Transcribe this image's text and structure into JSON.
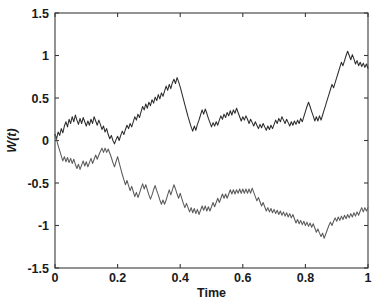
{
  "chart_data": {
    "type": "line",
    "title": "",
    "xlabel": "Time",
    "ylabel": "W(t)",
    "xlim": [
      0,
      1
    ],
    "ylim": [
      -1.5,
      1.5
    ],
    "grid": false,
    "legend": "none",
    "xticks": [
      0,
      0.2,
      0.4,
      0.6,
      0.8,
      1
    ],
    "xtick_labels": [
      "0",
      "0.2",
      "0.4",
      "0.6",
      "0.8",
      "1"
    ],
    "yticks": [
      -1.5,
      -1,
      -0.5,
      0,
      0.5,
      1,
      1.5
    ],
    "ytick_labels": [
      "-1.5",
      "-1",
      "-0.5",
      "0",
      "0.5",
      "1",
      "1.5"
    ],
    "x": [
      0,
      0.005,
      0.01,
      0.015,
      0.02,
      0.025,
      0.03,
      0.035,
      0.04,
      0.045,
      0.05,
      0.055,
      0.06,
      0.065,
      0.07,
      0.075,
      0.08,
      0.085,
      0.09,
      0.095,
      0.1,
      0.105,
      0.11,
      0.115,
      0.12,
      0.125,
      0.13,
      0.135,
      0.14,
      0.145,
      0.15,
      0.155,
      0.16,
      0.165,
      0.17,
      0.175,
      0.18,
      0.185,
      0.19,
      0.195,
      0.2,
      0.205,
      0.21,
      0.215,
      0.22,
      0.225,
      0.23,
      0.235,
      0.24,
      0.245,
      0.25,
      0.255,
      0.26,
      0.265,
      0.27,
      0.275,
      0.28,
      0.285,
      0.29,
      0.295,
      0.3,
      0.305,
      0.31,
      0.315,
      0.32,
      0.325,
      0.33,
      0.335,
      0.34,
      0.345,
      0.35,
      0.355,
      0.36,
      0.365,
      0.37,
      0.375,
      0.38,
      0.385,
      0.39,
      0.395,
      0.4,
      0.405,
      0.41,
      0.415,
      0.42,
      0.425,
      0.43,
      0.435,
      0.44,
      0.445,
      0.45,
      0.455,
      0.46,
      0.465,
      0.47,
      0.475,
      0.48,
      0.485,
      0.49,
      0.495,
      0.5,
      0.505,
      0.51,
      0.515,
      0.52,
      0.525,
      0.53,
      0.535,
      0.54,
      0.545,
      0.55,
      0.555,
      0.56,
      0.565,
      0.57,
      0.575,
      0.58,
      0.585,
      0.59,
      0.595,
      0.6,
      0.605,
      0.61,
      0.615,
      0.62,
      0.625,
      0.63,
      0.635,
      0.64,
      0.645,
      0.65,
      0.655,
      0.66,
      0.665,
      0.67,
      0.675,
      0.68,
      0.685,
      0.69,
      0.695,
      0.7,
      0.705,
      0.71,
      0.715,
      0.72,
      0.725,
      0.73,
      0.735,
      0.74,
      0.745,
      0.75,
      0.755,
      0.76,
      0.765,
      0.77,
      0.775,
      0.78,
      0.785,
      0.79,
      0.795,
      0.8,
      0.805,
      0.81,
      0.815,
      0.82,
      0.825,
      0.83,
      0.835,
      0.84,
      0.845,
      0.85,
      0.855,
      0.86,
      0.865,
      0.87,
      0.875,
      0.88,
      0.885,
      0.89,
      0.895,
      0.9,
      0.905,
      0.91,
      0.915,
      0.92,
      0.925,
      0.93,
      0.935,
      0.94,
      0.945,
      0.95,
      0.955,
      0.96,
      0.965,
      0.97,
      0.975,
      0.98,
      0.985,
      0.99,
      0.995,
      1
    ],
    "series": [
      {
        "name": "W1",
        "color": "#2b2b2b",
        "values": [
          0.07,
          0.02,
          0.1,
          0.06,
          0.14,
          0.09,
          0.17,
          0.22,
          0.16,
          0.25,
          0.2,
          0.28,
          0.22,
          0.3,
          0.24,
          0.19,
          0.26,
          0.2,
          0.27,
          0.22,
          0.17,
          0.23,
          0.18,
          0.25,
          0.2,
          0.28,
          0.23,
          0.18,
          0.24,
          0.19,
          0.13,
          0.17,
          0.1,
          0.14,
          0.07,
          0.02,
          0.06,
          0.0,
          -0.04,
          0.01,
          0.05,
          0.0,
          0.06,
          0.11,
          0.07,
          0.13,
          0.18,
          0.14,
          0.2,
          0.16,
          0.22,
          0.28,
          0.24,
          0.31,
          0.27,
          0.34,
          0.4,
          0.36,
          0.43,
          0.38,
          0.45,
          0.41,
          0.48,
          0.44,
          0.51,
          0.47,
          0.54,
          0.49,
          0.56,
          0.52,
          0.58,
          0.64,
          0.59,
          0.66,
          0.61,
          0.68,
          0.72,
          0.67,
          0.74,
          0.69,
          0.63,
          0.56,
          0.49,
          0.42,
          0.35,
          0.28,
          0.22,
          0.16,
          0.11,
          0.17,
          0.12,
          0.19,
          0.24,
          0.3,
          0.36,
          0.31,
          0.37,
          0.32,
          0.26,
          0.21,
          0.16,
          0.21,
          0.17,
          0.22,
          0.18,
          0.24,
          0.29,
          0.25,
          0.31,
          0.27,
          0.33,
          0.29,
          0.35,
          0.3,
          0.36,
          0.32,
          0.38,
          0.33,
          0.28,
          0.23,
          0.28,
          0.24,
          0.29,
          0.25,
          0.2,
          0.25,
          0.21,
          0.17,
          0.22,
          0.18,
          0.14,
          0.19,
          0.15,
          0.2,
          0.16,
          0.12,
          0.17,
          0.13,
          0.18,
          0.14,
          0.19,
          0.24,
          0.2,
          0.26,
          0.22,
          0.28,
          0.24,
          0.2,
          0.25,
          0.21,
          0.17,
          0.22,
          0.18,
          0.23,
          0.19,
          0.24,
          0.2,
          0.26,
          0.22,
          0.28,
          0.34,
          0.4,
          0.45,
          0.4,
          0.34,
          0.29,
          0.23,
          0.28,
          0.23,
          0.29,
          0.24,
          0.3,
          0.36,
          0.42,
          0.48,
          0.54,
          0.6,
          0.66,
          0.62,
          0.68,
          0.74,
          0.8,
          0.86,
          0.92,
          0.88,
          0.94,
          1.0,
          1.05,
          1.0,
          0.95,
          1.01,
          0.96,
          0.9,
          0.94,
          0.88,
          0.92,
          0.87,
          0.91,
          0.86,
          0.9,
          0.85
        ]
      },
      {
        "name": "W2",
        "color": "#5a5a5a",
        "values": [
          0.07,
          0.01,
          -0.06,
          -0.12,
          -0.18,
          -0.24,
          -0.19,
          -0.25,
          -0.2,
          -0.26,
          -0.21,
          -0.27,
          -0.22,
          -0.28,
          -0.33,
          -0.28,
          -0.34,
          -0.29,
          -0.24,
          -0.3,
          -0.25,
          -0.31,
          -0.26,
          -0.21,
          -0.27,
          -0.22,
          -0.17,
          -0.22,
          -0.17,
          -0.13,
          -0.09,
          -0.14,
          -0.09,
          -0.14,
          -0.1,
          -0.15,
          -0.2,
          -0.26,
          -0.31,
          -0.25,
          -0.19,
          -0.26,
          -0.33,
          -0.4,
          -0.46,
          -0.52,
          -0.47,
          -0.53,
          -0.59,
          -0.54,
          -0.6,
          -0.66,
          -0.61,
          -0.67,
          -0.62,
          -0.56,
          -0.51,
          -0.57,
          -0.52,
          -0.58,
          -0.64,
          -0.69,
          -0.64,
          -0.58,
          -0.53,
          -0.59,
          -0.64,
          -0.7,
          -0.75,
          -0.7,
          -0.75,
          -0.7,
          -0.64,
          -0.58,
          -0.64,
          -0.58,
          -0.52,
          -0.57,
          -0.63,
          -0.68,
          -0.62,
          -0.68,
          -0.74,
          -0.79,
          -0.74,
          -0.79,
          -0.84,
          -0.79,
          -0.85,
          -0.8,
          -0.86,
          -0.81,
          -0.87,
          -0.82,
          -0.77,
          -0.82,
          -0.77,
          -0.83,
          -0.78,
          -0.83,
          -0.78,
          -0.73,
          -0.78,
          -0.73,
          -0.68,
          -0.73,
          -0.68,
          -0.63,
          -0.68,
          -0.63,
          -0.68,
          -0.63,
          -0.58,
          -0.63,
          -0.58,
          -0.63,
          -0.58,
          -0.62,
          -0.57,
          -0.62,
          -0.57,
          -0.62,
          -0.57,
          -0.62,
          -0.57,
          -0.62,
          -0.56,
          -0.61,
          -0.66,
          -0.71,
          -0.67,
          -0.72,
          -0.77,
          -0.73,
          -0.78,
          -0.83,
          -0.79,
          -0.84,
          -0.8,
          -0.85,
          -0.81,
          -0.86,
          -0.82,
          -0.87,
          -0.83,
          -0.88,
          -0.84,
          -0.89,
          -0.85,
          -0.9,
          -0.86,
          -0.91,
          -0.87,
          -0.92,
          -0.97,
          -0.93,
          -0.98,
          -0.94,
          -0.99,
          -0.95,
          -1.0,
          -0.96,
          -1.01,
          -0.97,
          -1.02,
          -0.98,
          -1.03,
          -1.08,
          -1.04,
          -1.09,
          -1.13,
          -1.09,
          -1.15,
          -1.1,
          -1.05,
          -1.0,
          -0.96,
          -1.0,
          -0.95,
          -0.91,
          -0.95,
          -0.9,
          -0.94,
          -0.89,
          -0.93,
          -0.88,
          -0.92,
          -0.87,
          -0.91,
          -0.86,
          -0.9,
          -0.85,
          -0.89,
          -0.84,
          -0.88,
          -0.83,
          -0.79,
          -0.84,
          -0.79,
          -0.83,
          -0.79
        ]
      }
    ]
  },
  "axes": {
    "geometry": {
      "left": 55,
      "right": 368,
      "top": 13,
      "bottom": 268
    }
  }
}
